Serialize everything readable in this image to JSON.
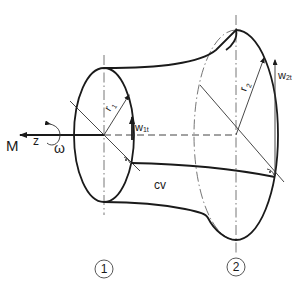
{
  "diagram": {
    "type": "control-volume turbomachine sketch",
    "labels": {
      "torque": "M",
      "axis": "z",
      "angular_velocity": "ω",
      "radius_inlet": "r",
      "radius_inlet_sub": "1",
      "radius_outlet": "r",
      "radius_outlet_sub": "2",
      "velocity_inlet": "w",
      "velocity_inlet_sub": "1t",
      "velocity_outlet": "w",
      "velocity_outlet_sub": "2t",
      "control_volume": "cv",
      "section_1": "1",
      "section_2": "2"
    },
    "colors": {
      "line": "#1a1a1a",
      "centerline": "#666666"
    }
  }
}
